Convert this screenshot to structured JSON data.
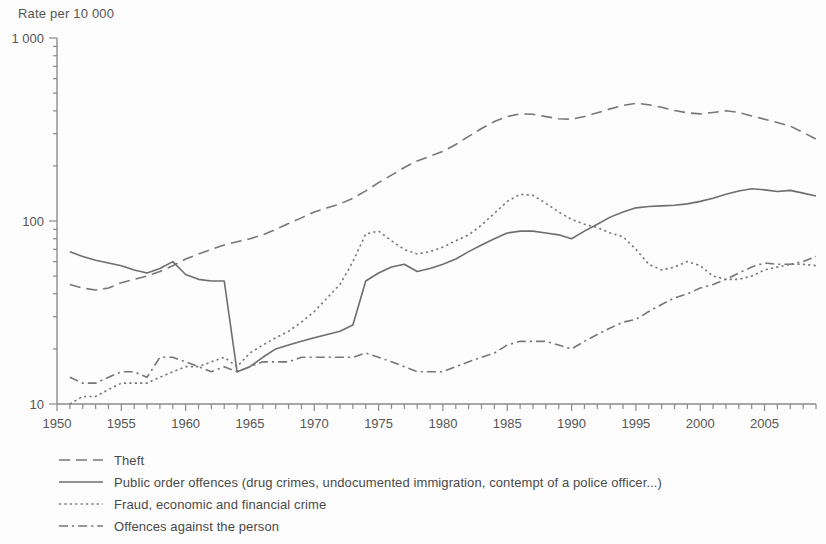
{
  "axis_title": "Rate per 10 000",
  "legend": [
    {
      "label": "Theft",
      "style": "dashed",
      "color": "#777777"
    },
    {
      "label": "Public order offences (drug crimes, undocumented immigration, contempt of a police officer...)",
      "style": "solid",
      "color": "#6e6e6e"
    },
    {
      "label": "Fraud, economic and financial crime",
      "style": "dotted",
      "color": "#777777"
    },
    {
      "label": "Offences against the person",
      "style": "dashdot",
      "color": "#777777"
    }
  ],
  "chart_data": {
    "type": "line",
    "title": "",
    "xlabel": "",
    "ylabel": "Rate per 10 000",
    "yscale": "log",
    "ylim": [
      10,
      1000
    ],
    "ytick_labels": [
      "10",
      "100",
      "1 000"
    ],
    "ytick_values": [
      10,
      100,
      1000
    ],
    "xlim": [
      1950,
      2009
    ],
    "xtick_labels": [
      "1950",
      "1955",
      "1960",
      "1965",
      "1970",
      "1975",
      "1980",
      "1985",
      "1990",
      "1995",
      "2000",
      "2005"
    ],
    "xtick_values": [
      1950,
      1955,
      1960,
      1965,
      1970,
      1975,
      1980,
      1985,
      1990,
      1995,
      2000,
      2005
    ],
    "grid": false,
    "legend_position": "below",
    "x": [
      1951,
      1952,
      1953,
      1954,
      1955,
      1956,
      1957,
      1958,
      1959,
      1960,
      1961,
      1962,
      1963,
      1964,
      1965,
      1966,
      1967,
      1968,
      1969,
      1970,
      1971,
      1972,
      1973,
      1974,
      1975,
      1976,
      1977,
      1978,
      1979,
      1980,
      1981,
      1982,
      1983,
      1984,
      1985,
      1986,
      1987,
      1988,
      1989,
      1990,
      1991,
      1992,
      1993,
      1994,
      1995,
      1996,
      1997,
      1998,
      1999,
      2000,
      2001,
      2002,
      2003,
      2004,
      2005,
      2006,
      2007,
      2008,
      2009
    ],
    "series": [
      {
        "name": "Theft",
        "style": "dashed",
        "color": "#777777",
        "values": [
          45,
          43,
          42,
          43,
          46,
          48,
          50,
          53,
          57,
          62,
          66,
          70,
          74,
          77,
          80,
          84,
          90,
          97,
          104,
          112,
          118,
          124,
          133,
          146,
          162,
          178,
          196,
          213,
          226,
          240,
          262,
          290,
          320,
          350,
          372,
          385,
          383,
          372,
          362,
          360,
          372,
          390,
          410,
          428,
          440,
          432,
          418,
          402,
          390,
          385,
          392,
          400,
          392,
          375,
          360,
          345,
          330,
          305,
          280
        ]
      },
      {
        "name": "Public order offences (drug crimes, undocumented immigration, contempt of a police officer...)",
        "style": "solid",
        "color": "#6e6e6e",
        "values": [
          68,
          64,
          61,
          59,
          57,
          54,
          52,
          55,
          60,
          51,
          48,
          47,
          47,
          15,
          16,
          18,
          20,
          21,
          22,
          23,
          24,
          25,
          27,
          47,
          52,
          56,
          58,
          53,
          55,
          58,
          62,
          68,
          74,
          80,
          86,
          88,
          88,
          86,
          84,
          80,
          88,
          96,
          105,
          112,
          118,
          120,
          121,
          122,
          124,
          128,
          133,
          140,
          146,
          150,
          148,
          145,
          147,
          142,
          137
        ]
      },
      {
        "name": "Fraud, economic and financial crime",
        "style": "dotted",
        "color": "#777777",
        "values": [
          10,
          11,
          11,
          12,
          13,
          13,
          13,
          14,
          15,
          16,
          16,
          17,
          18,
          16,
          19,
          21,
          23,
          25,
          28,
          32,
          38,
          45,
          60,
          85,
          88,
          78,
          70,
          66,
          68,
          72,
          78,
          84,
          95,
          110,
          128,
          140,
          138,
          125,
          112,
          102,
          96,
          92,
          86,
          82,
          70,
          58,
          54,
          56,
          60,
          57,
          50,
          48,
          48,
          50,
          54,
          56,
          58,
          58,
          57
        ]
      },
      {
        "name": "Offences against the person",
        "style": "dashdot",
        "color": "#777777",
        "values": [
          14,
          13,
          13,
          14,
          15,
          15,
          14,
          18,
          18,
          17,
          16,
          15,
          16,
          15,
          16,
          17,
          17,
          17,
          18,
          18,
          18,
          18,
          18,
          19,
          18,
          17,
          16,
          15,
          15,
          15,
          16,
          17,
          18,
          19,
          21,
          22,
          22,
          22,
          21,
          20,
          22,
          24,
          26,
          28,
          29,
          32,
          35,
          38,
          40,
          43,
          45,
          48,
          52,
          56,
          59,
          58,
          58,
          60,
          64
        ]
      }
    ]
  }
}
